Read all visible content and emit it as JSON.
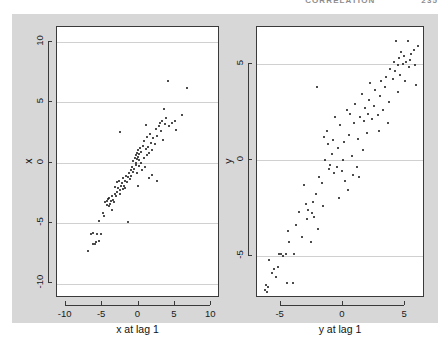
{
  "header": {
    "title": "CORRELATION",
    "page_number": "235"
  },
  "figure": {
    "background_color": "#d7d7d7",
    "panel_background": "#ffffff",
    "point_color": "#101010",
    "grid_color": "#d0d0d0",
    "axis_color": "#3a3a3a"
  },
  "chart_data": [
    {
      "type": "scatter",
      "id": "left-lag-plot",
      "title": "",
      "xlabel": "x at lag 1",
      "ylabel": "x",
      "xlim": [
        -11.2,
        11.2
      ],
      "ylim": [
        -11.2,
        11.2
      ],
      "xticks": [
        -10,
        -5,
        0,
        5,
        10
      ],
      "yticks": [
        -10,
        -5,
        0,
        5,
        10
      ],
      "xticklabels": [
        "-10",
        "-5",
        "0",
        "5",
        "10"
      ],
      "yticklabels": [
        "-10",
        "-5",
        "0",
        "5",
        "10"
      ],
      "grid": true,
      "gridlines_y": [
        -10,
        -5,
        0,
        5,
        10
      ],
      "legend": null,
      "points": [
        [
          -7.0,
          -7.3
        ],
        [
          -6.6,
          -5.9
        ],
        [
          -6.3,
          -5.8
        ],
        [
          -6.2,
          -6.7
        ],
        [
          -6.0,
          -6.7
        ],
        [
          -5.9,
          -6.6
        ],
        [
          -5.7,
          -5.9
        ],
        [
          -5.5,
          -4.8
        ],
        [
          -5.4,
          -6.5
        ],
        [
          -5.1,
          -5.9
        ],
        [
          -4.9,
          -4.2
        ],
        [
          -4.7,
          -4.4
        ],
        [
          -4.6,
          -3.3
        ],
        [
          -4.4,
          -3.2
        ],
        [
          -4.3,
          -3.5
        ],
        [
          -4.2,
          -3.0
        ],
        [
          -4.1,
          -3.6
        ],
        [
          -4.0,
          -2.9
        ],
        [
          -3.9,
          -3.4
        ],
        [
          -3.8,
          -3.2
        ],
        [
          -3.7,
          -3.9
        ],
        [
          -3.6,
          -2.8
        ],
        [
          -3.5,
          -3.1
        ],
        [
          -3.4,
          -3.3
        ],
        [
          -3.3,
          -2.6
        ],
        [
          -3.2,
          -2.0
        ],
        [
          -3.1,
          -2.8
        ],
        [
          -3.0,
          -1.6
        ],
        [
          -2.9,
          -2.4
        ],
        [
          -2.8,
          -2.1
        ],
        [
          -2.7,
          -1.5
        ],
        [
          -2.6,
          -2.3
        ],
        [
          -2.5,
          -2.6
        ],
        [
          -2.4,
          -1.9
        ],
        [
          -2.3,
          -1.7
        ],
        [
          -2.2,
          -2.2
        ],
        [
          -2.1,
          -1.3
        ],
        [
          -2.0,
          -1.9
        ],
        [
          -1.9,
          -2.1
        ],
        [
          -1.8,
          -1.5
        ],
        [
          -1.7,
          -1.1
        ],
        [
          -1.6,
          -1.6
        ],
        [
          -1.5,
          -4.9
        ],
        [
          -1.4,
          -1.2
        ],
        [
          -1.3,
          -0.9
        ],
        [
          -1.2,
          -1.4
        ],
        [
          -1.1,
          -0.6
        ],
        [
          -1.0,
          -1.1
        ],
        [
          -0.9,
          -0.4
        ],
        [
          -0.8,
          -0.8
        ],
        [
          -0.7,
          0.1
        ],
        [
          -0.6,
          -0.5
        ],
        [
          -0.5,
          0.4
        ],
        [
          -0.4,
          -0.2
        ],
        [
          -0.35,
          0.6
        ],
        [
          -0.3,
          0.0
        ],
        [
          -0.25,
          0.8
        ],
        [
          -0.2,
          0.3
        ],
        [
          -0.15,
          -0.9
        ],
        [
          -0.1,
          0.5
        ],
        [
          -0.05,
          1.0
        ],
        [
          0.0,
          0.2
        ],
        [
          0.05,
          -0.3
        ],
        [
          0.1,
          0.7
        ],
        [
          0.2,
          1.2
        ],
        [
          0.3,
          0.0
        ],
        [
          0.4,
          0.9
        ],
        [
          0.5,
          -0.6
        ],
        [
          0.6,
          1.4
        ],
        [
          0.7,
          0.4
        ],
        [
          0.8,
          1.8
        ],
        [
          0.9,
          -0.4
        ],
        [
          1.0,
          1.1
        ],
        [
          1.1,
          0.6
        ],
        [
          1.2,
          2.1
        ],
        [
          1.3,
          1.3
        ],
        [
          1.4,
          -1.3
        ],
        [
          1.5,
          0.8
        ],
        [
          1.6,
          2.4
        ],
        [
          1.7,
          1.6
        ],
        [
          1.8,
          -1.0
        ],
        [
          1.9,
          1.0
        ],
        [
          2.0,
          2.0
        ],
        [
          2.2,
          1.5
        ],
        [
          2.4,
          2.8
        ],
        [
          2.5,
          -1.5
        ],
        [
          2.6,
          2.2
        ],
        [
          2.8,
          3.0
        ],
        [
          3.0,
          3.3
        ],
        [
          3.1,
          2.6
        ],
        [
          3.2,
          3.4
        ],
        [
          3.3,
          1.9
        ],
        [
          3.5,
          4.4
        ],
        [
          3.6,
          3.2
        ],
        [
          3.8,
          3.7
        ],
        [
          4.0,
          6.7
        ],
        [
          4.2,
          3.0
        ],
        [
          4.6,
          3.3
        ],
        [
          5.0,
          3.4
        ],
        [
          5.2,
          2.7
        ],
        [
          6.0,
          3.9
        ],
        [
          6.6,
          6.2
        ],
        [
          -2.5,
          2.5
        ],
        [
          -0.1,
          -1.9
        ],
        [
          1.0,
          3.1
        ]
      ]
    },
    {
      "type": "scatter",
      "id": "right-lag-plot",
      "title": "",
      "xlabel": "y at lag 1",
      "ylabel": "y",
      "xlim": [
        -6.9,
        6.6
      ],
      "ylim": [
        -7.2,
        6.9
      ],
      "xticks": [
        -5,
        0,
        5
      ],
      "yticks": [
        -5,
        0,
        5
      ],
      "xticklabels": [
        "-5",
        "0",
        "5"
      ],
      "yticklabels": [
        "-5",
        "0",
        "5"
      ],
      "grid": true,
      "gridlines_y": [
        -5,
        0,
        5
      ],
      "legend": null,
      "points": [
        [
          -6.3,
          -6.8
        ],
        [
          -6.2,
          -6.5
        ],
        [
          -6.1,
          -6.9
        ],
        [
          -6.0,
          -6.6
        ],
        [
          -5.9,
          -5.2
        ],
        [
          -5.7,
          -5.9
        ],
        [
          -5.5,
          -5.7
        ],
        [
          -5.4,
          -6.1
        ],
        [
          -5.2,
          -5.6
        ],
        [
          -5.1,
          -4.9
        ],
        [
          -5.0,
          -4.9
        ],
        [
          -4.8,
          -5.0
        ],
        [
          -4.6,
          -4.9
        ],
        [
          -4.5,
          -6.4
        ],
        [
          -4.4,
          -3.7
        ],
        [
          -4.3,
          -4.3
        ],
        [
          -4.0,
          -6.4
        ],
        [
          -3.9,
          -4.9
        ],
        [
          -3.8,
          -3.4
        ],
        [
          -3.5,
          -2.7
        ],
        [
          -3.3,
          -4.0
        ],
        [
          -3.1,
          -1.3
        ],
        [
          -3.0,
          -2.3
        ],
        [
          -2.9,
          -3.1
        ],
        [
          -2.8,
          -2.6
        ],
        [
          -2.6,
          -4.3
        ],
        [
          -2.5,
          -2.8
        ],
        [
          -2.4,
          -2.2
        ],
        [
          -2.3,
          -3.0
        ],
        [
          -2.2,
          -1.8
        ],
        [
          -2.1,
          3.8
        ],
        [
          -2.0,
          -3.6
        ],
        [
          -1.9,
          -0.9
        ],
        [
          -1.7,
          -1.2
        ],
        [
          -1.6,
          -2.4
        ],
        [
          -1.5,
          1.2
        ],
        [
          -1.4,
          0.0
        ],
        [
          -1.3,
          1.5
        ],
        [
          -1.2,
          0.8
        ],
        [
          -1.1,
          -0.5
        ],
        [
          -1.0,
          -0.3
        ],
        [
          -0.9,
          0.3
        ],
        [
          -0.8,
          1.0
        ],
        [
          -0.7,
          -0.7
        ],
        [
          -0.6,
          2.2
        ],
        [
          -0.5,
          -0.4
        ],
        [
          -0.4,
          0.6
        ],
        [
          -0.3,
          -2.0
        ],
        [
          -0.2,
          1.8
        ],
        [
          -0.1,
          -0.6
        ],
        [
          0.0,
          0.0
        ],
        [
          0.1,
          0.9
        ],
        [
          0.2,
          -1.1
        ],
        [
          0.3,
          2.6
        ],
        [
          0.4,
          -1.6
        ],
        [
          0.5,
          1.3
        ],
        [
          0.6,
          2.4
        ],
        [
          0.7,
          0.2
        ],
        [
          0.8,
          -0.8
        ],
        [
          0.9,
          1.9
        ],
        [
          1.0,
          2.9
        ],
        [
          1.1,
          -0.4
        ],
        [
          1.2,
          1.1
        ],
        [
          1.3,
          -0.9
        ],
        [
          1.4,
          2.2
        ],
        [
          1.5,
          3.4
        ],
        [
          1.6,
          0.5
        ],
        [
          1.7,
          2.0
        ],
        [
          1.8,
          2.7
        ],
        [
          1.9,
          1.4
        ],
        [
          2.0,
          2.4
        ],
        [
          2.1,
          3.1
        ],
        [
          2.2,
          4.0
        ],
        [
          2.3,
          2.1
        ],
        [
          2.5,
          2.8
        ],
        [
          2.6,
          3.6
        ],
        [
          2.8,
          2.3
        ],
        [
          3.0,
          3.3
        ],
        [
          3.1,
          4.1
        ],
        [
          3.2,
          2.6
        ],
        [
          3.4,
          3.8
        ],
        [
          3.5,
          4.3
        ],
        [
          3.7,
          3.0
        ],
        [
          3.8,
          4.7
        ],
        [
          4.0,
          4.2
        ],
        [
          4.1,
          5.1
        ],
        [
          4.2,
          4.6
        ],
        [
          4.3,
          6.2
        ],
        [
          4.4,
          4.9
        ],
        [
          4.5,
          5.3
        ],
        [
          4.6,
          4.4
        ],
        [
          4.7,
          5.6
        ],
        [
          4.8,
          5.0
        ],
        [
          4.9,
          5.4
        ],
        [
          5.0,
          4.1
        ],
        [
          5.1,
          5.1
        ],
        [
          5.2,
          6.2
        ],
        [
          5.3,
          4.8
        ],
        [
          5.4,
          5.2
        ],
        [
          5.5,
          5.5
        ],
        [
          5.7,
          5.7
        ],
        [
          5.8,
          4.9
        ],
        [
          6.0,
          5.9
        ],
        [
          5.9,
          3.9
        ],
        [
          4.4,
          3.5
        ],
        [
          3.6,
          1.9
        ],
        [
          2.9,
          1.5
        ]
      ]
    }
  ]
}
